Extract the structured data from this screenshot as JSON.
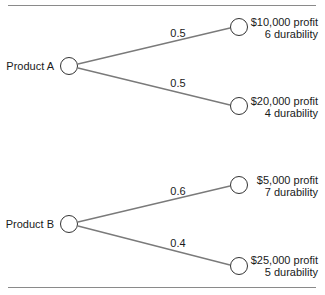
{
  "diagram": {
    "type": "decision-tree",
    "trees": [
      {
        "root": "Product A",
        "branches": [
          {
            "probability": "0.5",
            "profit": "$10,000 profit",
            "durability": "6 durability"
          },
          {
            "probability": "0.5",
            "profit": "$20,000 profit",
            "durability": "4 durability"
          }
        ]
      },
      {
        "root": "Product B",
        "branches": [
          {
            "probability": "0.6",
            "profit": "$5,000 profit",
            "durability": "7 durability"
          },
          {
            "probability": "0.4",
            "profit": "$25,000 profit",
            "durability": "5 durability"
          }
        ]
      }
    ],
    "colors": {
      "line": "#7a7a7a",
      "node_stroke": "#333333",
      "rule": "#8a8a8a"
    }
  }
}
